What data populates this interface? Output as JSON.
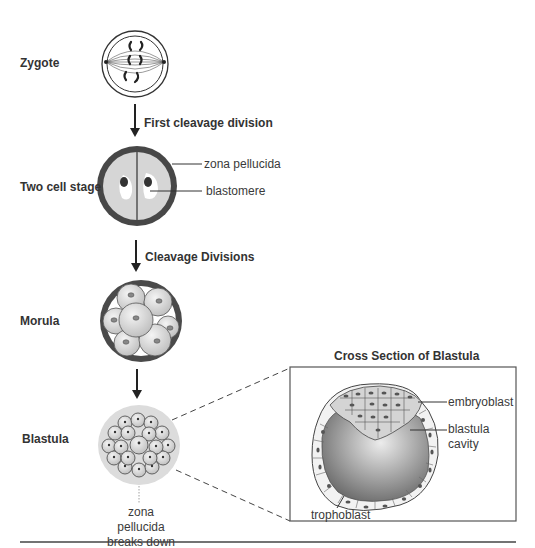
{
  "stages": [
    {
      "id": "zygote",
      "label": "Zygote"
    },
    {
      "id": "two-cell",
      "label": "Two cell stage"
    },
    {
      "id": "morula",
      "label": "Morula"
    },
    {
      "id": "blastula",
      "label": "Blastula"
    }
  ],
  "arrows": [
    {
      "label": "First cleavage division"
    },
    {
      "label": "Cleavage Divisions"
    }
  ],
  "annotations": {
    "zona_pellucida": "zona pellucida",
    "blastomere": "blastomere",
    "zona_breaks_line1": "zona pellucida",
    "zona_breaks_line2": "breaks down"
  },
  "cross_section": {
    "title": "Cross Section of Blastula",
    "embryoblast": "embryoblast",
    "cavity_line1": "blastula",
    "cavity_line2": "cavity",
    "trophoblast": "trophoblast"
  },
  "colors": {
    "zona_dark": "#4a4a4a",
    "cell_fill": "#d9d9d9",
    "cavity_center": "#e8e8e8",
    "cavity_edge": "#6e6e6e",
    "line": "#333333"
  }
}
